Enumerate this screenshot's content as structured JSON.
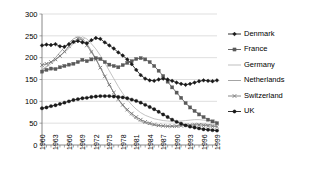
{
  "chart_data": {
    "type": "line",
    "title": "",
    "xlabel": "",
    "ylabel": "",
    "xlim": [
      1960,
      1999
    ],
    "ylim": [
      0,
      300
    ],
    "yticks": [
      0,
      50,
      100,
      150,
      200,
      250,
      300
    ],
    "grid": true,
    "legend_position": "right",
    "x": [
      1960,
      1961,
      1962,
      1963,
      1964,
      1965,
      1966,
      1967,
      1968,
      1969,
      1970,
      1971,
      1972,
      1973,
      1974,
      1975,
      1976,
      1977,
      1978,
      1979,
      1980,
      1981,
      1982,
      1983,
      1984,
      1985,
      1986,
      1987,
      1988,
      1989,
      1990,
      1991,
      1992,
      1993,
      1994,
      1995,
      1996,
      1997,
      1998,
      1999
    ],
    "xticks": [
      1960,
      1963,
      1966,
      1969,
      1972,
      1975,
      1978,
      1981,
      1984,
      1987,
      1990,
      1993,
      1996,
      1999
    ],
    "xtick_labels": [
      "1960",
      "1963",
      "1966",
      "1969",
      "1972",
      "1975",
      "1978",
      "1981",
      "1984",
      "1987",
      "1990",
      "1993",
      "1996",
      "1999"
    ],
    "series": [
      {
        "name": "Denmark",
        "color": "#1a1a1a",
        "marker": "diamond",
        "values": [
          228,
          230,
          229,
          231,
          226,
          225,
          231,
          236,
          238,
          235,
          233,
          240,
          245,
          243,
          235,
          228,
          221,
          212,
          205,
          196,
          185,
          172,
          160,
          152,
          148,
          147,
          150,
          152,
          150,
          147,
          143,
          140,
          138,
          140,
          143,
          146,
          148,
          147,
          146,
          148
        ]
      },
      {
        "name": "France",
        "color": "#5a5a5a",
        "marker": "square",
        "values": [
          168,
          172,
          175,
          174,
          178,
          181,
          184,
          186,
          190,
          195,
          192,
          196,
          199,
          197,
          190,
          184,
          181,
          178,
          183,
          188,
          192,
          197,
          199,
          196,
          190,
          181,
          170,
          158,
          145,
          132,
          120,
          108,
          96,
          86,
          78,
          70,
          64,
          58,
          54,
          50
        ]
      },
      {
        "name": "Germany",
        "color": "#b8b8b8",
        "marker": "none",
        "values": [
          170,
          178,
          186,
          194,
          203,
          212,
          221,
          232,
          240,
          248,
          243,
          232,
          220,
          205,
          188,
          170,
          152,
          134,
          118,
          104,
          92,
          82,
          74,
          68,
          64,
          60,
          58,
          56,
          55,
          54,
          54,
          55,
          56,
          57,
          58,
          58,
          57,
          56,
          55,
          54
        ]
      },
      {
        "name": "Netherlands",
        "color": "#9a9a9a",
        "marker": "none",
        "values": [
          172,
          180,
          190,
          200,
          212,
          224,
          234,
          243,
          248,
          244,
          232,
          216,
          198,
          178,
          158,
          138,
          120,
          104,
          90,
          78,
          68,
          60,
          54,
          50,
          47,
          45,
          44,
          43,
          43,
          43,
          44,
          45,
          46,
          47,
          48,
          48,
          48,
          47,
          46,
          45
        ]
      },
      {
        "name": "Switzerland",
        "color": "#7a7a7a",
        "marker": "cross",
        "values": [
          183,
          186,
          190,
          196,
          204,
          214,
          226,
          236,
          244,
          240,
          228,
          213,
          196,
          177,
          157,
          138,
          120,
          105,
          92,
          81,
          72,
          64,
          58,
          53,
          50,
          47,
          45,
          44,
          43,
          43,
          43,
          44,
          45,
          45,
          46,
          46,
          45,
          44,
          43,
          42
        ]
      },
      {
        "name": "UK",
        "color": "#1a1a1a",
        "marker": "circle",
        "values": [
          84,
          86,
          89,
          91,
          94,
          97,
          100,
          103,
          105,
          107,
          108,
          110,
          111,
          112,
          112,
          112,
          111,
          110,
          109,
          107,
          104,
          101,
          97,
          92,
          87,
          82,
          76,
          70,
          64,
          58,
          53,
          49,
          45,
          42,
          40,
          38,
          36,
          35,
          34,
          33
        ]
      }
    ]
  },
  "legend": {
    "items": [
      {
        "label": "Denmark"
      },
      {
        "label": "France"
      },
      {
        "label": "Germany"
      },
      {
        "label": "Netherlands"
      },
      {
        "label": "Switzerland"
      },
      {
        "label": "UK"
      }
    ]
  }
}
